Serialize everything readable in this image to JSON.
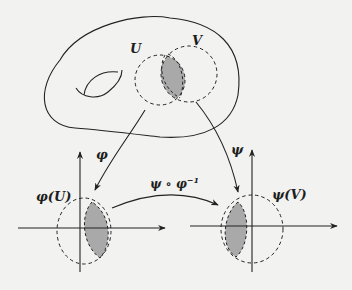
{
  "diagram": {
    "type": "manifold-charts-transition-map",
    "colors": {
      "background": "#f2f2f0",
      "stroke": "#222222",
      "overlap_fill": "#a9a9a9"
    },
    "manifold": {
      "open_sets": [
        {
          "label": "U"
        },
        {
          "label": "V"
        }
      ],
      "has_handle": true
    },
    "maps": [
      {
        "label": "φ",
        "from": "U",
        "to": "φ(U)"
      },
      {
        "label": "ψ",
        "from": "V",
        "to": "ψ(V)"
      },
      {
        "label": "ψ ∘ φ",
        "sup": "−1",
        "from": "φ(U)",
        "to": "ψ(V)"
      }
    ],
    "charts": [
      {
        "label": "φ(U)"
      },
      {
        "label": "ψ(V)"
      }
    ]
  }
}
